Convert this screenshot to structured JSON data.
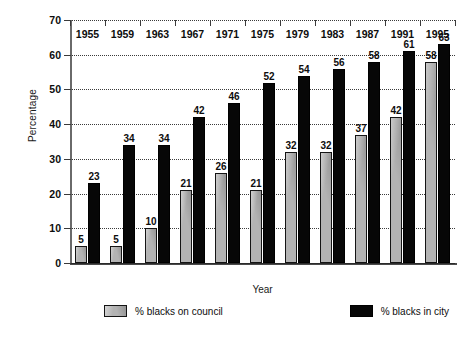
{
  "chart_data": {
    "type": "bar",
    "title": "",
    "xlabel": "Year",
    "ylabel": "Percentage",
    "categories": [
      "1955",
      "1959",
      "1963",
      "1967",
      "1971",
      "1975",
      "1979",
      "1983",
      "1987",
      "1991",
      "1995"
    ],
    "series": [
      {
        "name": "% blacks on council",
        "color": "#b3b3b3",
        "values": [
          5,
          5,
          10,
          21,
          26,
          21,
          32,
          32,
          37,
          42,
          58
        ]
      },
      {
        "name": "% blacks in city",
        "color": "#070707",
        "values": [
          23,
          34,
          34,
          42,
          46,
          52,
          54,
          56,
          58,
          61,
          63
        ]
      }
    ],
    "ylim": [
      0,
      70
    ],
    "yticks": [
      0,
      10,
      20,
      30,
      40,
      50,
      60,
      70
    ],
    "ytick_labels": [
      "0",
      "10",
      "20",
      "30",
      "40",
      "50",
      "60",
      "70"
    ],
    "grid": true,
    "grid_style": "dotted-horizontal",
    "legend_position": "bottom",
    "data_labels": true
  },
  "legend": {
    "entries": [
      {
        "label": "% blacks on council",
        "swatch": "grey-swatch"
      },
      {
        "label": "% blacks in city",
        "swatch": "black-swatch"
      }
    ]
  }
}
